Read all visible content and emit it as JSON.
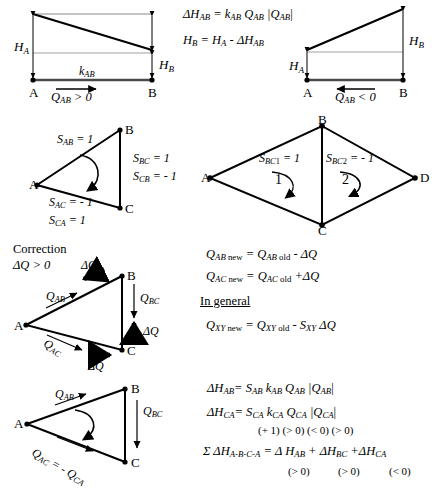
{
  "figure": {
    "ink_color": "#000000",
    "thin_line_color": "#7f7f7f"
  },
  "row1": {
    "left_diagram": {
      "name": "positive-flow-head-loss-diagram",
      "node_a": "A",
      "node_b": "B",
      "label_ha": "H",
      "label_ha_sub": "A",
      "label_hb": "H",
      "label_hb_sub": "B",
      "label_k": "k",
      "label_k_sub": "AB",
      "flow_label": "Q",
      "flow_label_sub": "AB",
      "flow_condition": "> 0"
    },
    "equations": {
      "eq1_lhs": "ΔH",
      "eq1_lhs_sub": "AB",
      "eq1_rhs": "= k",
      "eq1_rhs_sub1": "AB",
      "eq1_mid": " Q",
      "eq1_sub2": "AB",
      "eq1_abs": "|Q",
      "eq1_sub3": "AB",
      "eq1_abs_close": "|",
      "eq2_lhs": "H",
      "eq2_lhs_sub": "B",
      "eq2_rhs": "= H",
      "eq2_sub_a": "A",
      "eq2_minus": " - ΔH",
      "eq2_sub_ab": "AB"
    },
    "right_diagram": {
      "name": "negative-flow-head-loss-diagram",
      "node_a": "A",
      "node_b": "B",
      "label_ha": "H",
      "label_ha_sub": "A",
      "label_hb": "H",
      "label_hb_sub": "B",
      "flow_label": "Q",
      "flow_label_sub": "AB",
      "flow_condition": "< 0"
    }
  },
  "row2": {
    "triangle": {
      "name": "sign-convention-triangle",
      "node_a": "A",
      "node_b": "B",
      "node_c": "C",
      "s_ab": "S",
      "s_ab_sub": "AB",
      "s_ab_val": "= 1",
      "s_bc": "S",
      "s_bc_sub": "BC",
      "s_bc_val": "= 1",
      "s_cb": "S",
      "s_cb_sub": "CB",
      "s_cb_val": "= - 1",
      "s_ac": "S",
      "s_ac_sub": "AC",
      "s_ac_val": "= - 1",
      "s_ca": "S",
      "s_ca_sub": "CA",
      "s_ca_val": "= 1"
    },
    "rhombus": {
      "name": "shared-branch-two-loops-rhombus",
      "node_a": "A",
      "node_b": "B",
      "node_c": "C",
      "node_d": "D",
      "s_bc1": "S",
      "s_bc1_sub": "BC",
      "s_bc1_sub2": "1",
      "s_bc1_val": "= 1",
      "s_bc2": "S",
      "s_bc2_sub": "BC",
      "s_bc2_sub2": "2",
      "s_bc2_val": "= - 1",
      "loop1_label": "1",
      "loop2_label": "2"
    }
  },
  "row3": {
    "correction_heading": "Correction",
    "correction_condition": "ΔQ > 0",
    "triangle": {
      "name": "flow-correction-triangle",
      "node_a": "A",
      "node_b": "B",
      "node_c": "C",
      "q_ab": "Q",
      "q_ab_sub": "AB",
      "q_bc": "Q",
      "q_bc_sub": "BC",
      "q_ac": "Q",
      "q_ac_sub": "AC",
      "delta_q_ab": "ΔQ",
      "delta_q_bc": "ΔQ",
      "delta_q_ac": "ΔQ"
    },
    "equations": {
      "line1": {
        "lhs": "Q",
        "lhs_sub": "AB",
        "lhs_state": " new",
        "eq": "= Q",
        "rhs_sub": "AB",
        "rhs_state": " old",
        "tail": " - ΔQ"
      },
      "line2": {
        "lhs": "Q",
        "lhs_sub": "AC",
        "lhs_state": " new",
        "eq": "= Q",
        "rhs_sub": "AC",
        "rhs_state": " old",
        "tail": " +ΔQ"
      },
      "in_general": "In general",
      "line3": {
        "lhs": "Q",
        "lhs_sub": "XY",
        "lhs_state": " new",
        "eq": "= Q",
        "rhs_sub": "XY",
        "rhs_state": " old",
        "tail": " - S",
        "tail_sub": "XY",
        "tail_end": " ΔQ"
      }
    }
  },
  "row4": {
    "triangle": {
      "name": "loop-flow-direction-triangle",
      "node_a": "A",
      "node_b": "B",
      "node_c": "C",
      "q_ab": "Q",
      "q_ab_sub": "AB",
      "q_bc": "Q",
      "q_bc_sub": "BC",
      "q_ac_expr": "Q",
      "q_ac_sub": "AC",
      "q_ac_eq": " = - Q",
      "q_ca_sub": "CA"
    },
    "equations": {
      "line1": {
        "lhs": "ΔH",
        "lhs_sub": "AB",
        "eq": "= S",
        "s_sub": "AB",
        "k": " k",
        "k_sub": "AB",
        "q": " Q",
        "q_sub": "AB",
        "abs": " |Q",
        "abs_sub": "AB",
        "abs_close": "|"
      },
      "line2": {
        "lhs": "ΔH",
        "lhs_sub": "CA",
        "eq": "= S",
        "s_sub": "CA",
        "k": " k",
        "k_sub": "CA",
        "q": " Q",
        "q_sub": "CA",
        "abs": " |Q",
        "abs_sub": "CA",
        "abs_close": "|"
      },
      "signs_line": "(+ 1) (> 0) (< 0) (> 0)",
      "line3": {
        "sigma": "Σ ΔH",
        "sigma_sub": "A-B-C-A",
        "eq": " = Δ H",
        "t1_sub": "AB",
        "plus1": " + ΔH",
        "t2_sub": "BC",
        "plus2": " +ΔH",
        "t3_sub": "CA"
      },
      "signs_line2_a": "(> 0)",
      "signs_line2_b": "(> 0)",
      "signs_line2_c": "(< 0)"
    }
  }
}
